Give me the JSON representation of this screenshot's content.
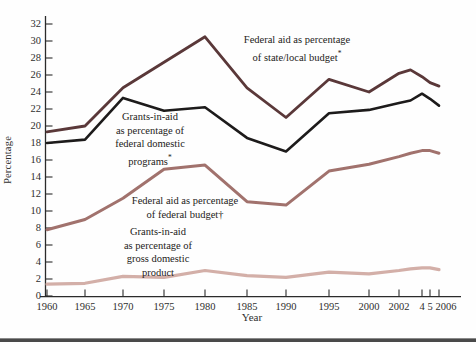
{
  "chart_data": {
    "type": "line",
    "title": "",
    "xlabel": "Year",
    "ylabel": "Percentage",
    "ylim": [
      0,
      32
    ],
    "grid": false,
    "legend_position": "inline-annotations",
    "y_ticks": [
      0,
      2,
      4,
      6,
      8,
      10,
      12,
      14,
      16,
      18,
      20,
      22,
      24,
      26,
      28,
      30,
      32
    ],
    "x_ticks": [
      {
        "label": "1960",
        "year": 1960
      },
      {
        "label": "1965",
        "year": 1965
      },
      {
        "label": "1970",
        "year": 1970
      },
      {
        "label": "1975",
        "year": 1975
      },
      {
        "label": "1980",
        "year": 1980
      },
      {
        "label": "1985",
        "year": 1985
      },
      {
        "label": "1990",
        "year": 1990
      },
      {
        "label": "1995",
        "year": 1995
      },
      {
        "label": "2000",
        "year": 2000
      },
      {
        "label": "2002",
        "year": 2002
      },
      {
        "label": "4",
        "year": 2004
      },
      {
        "label": "5",
        "year": 2005
      },
      {
        "label": "2006",
        "year": 2006
      }
    ],
    "years": [
      1960,
      1965,
      1970,
      1975,
      1980,
      1985,
      1990,
      1995,
      2000,
      2002,
      2003,
      2004,
      2005,
      2006
    ],
    "series": [
      {
        "name": "Federal aid as percentage of state/local budget*",
        "annotation_lines": [
          "Federal aid as percentage",
          "of state/local budget*"
        ],
        "color": "#5a3839",
        "values": [
          19.3,
          20.0,
          24.5,
          27.5,
          30.5,
          24.5,
          21.0,
          25.5,
          24.0,
          26.2,
          26.6,
          25.8,
          25.1,
          24.7
        ]
      },
      {
        "name": "Grants-in-aid as percentage of federal domestic programs*",
        "annotation_lines": [
          "Grants-in-aid",
          "as percentage of",
          "federal domestic",
          "programs*"
        ],
        "color": "#1d1b1b",
        "values": [
          18.0,
          18.4,
          23.3,
          21.8,
          22.2,
          18.6,
          17.0,
          21.5,
          21.9,
          22.7,
          23.0,
          23.8,
          23.2,
          22.4
        ]
      },
      {
        "name": "Federal aid as percentage of federal budget†",
        "annotation_lines": [
          "Federal aid as percentage",
          "of federal budget†"
        ],
        "color": "#a1726d",
        "values": [
          7.8,
          9.0,
          11.5,
          14.9,
          15.4,
          11.1,
          10.7,
          14.7,
          15.5,
          16.4,
          16.8,
          17.1,
          17.1,
          16.8
        ]
      },
      {
        "name": "Grants-in-aid as percentage of gross domestic product",
        "annotation_lines": [
          "Grants-in-aid",
          "as percentage of",
          "gross domestic",
          "product"
        ],
        "color": "#d3afa8",
        "values": [
          1.4,
          1.5,
          2.3,
          2.2,
          3.0,
          2.4,
          2.2,
          2.8,
          2.6,
          3.0,
          3.2,
          3.3,
          3.3,
          3.1
        ]
      }
    ],
    "axis_color": "#2b2b2b",
    "background_color": "#fefefe",
    "bottom_rule_color": "#4a4a4a"
  }
}
